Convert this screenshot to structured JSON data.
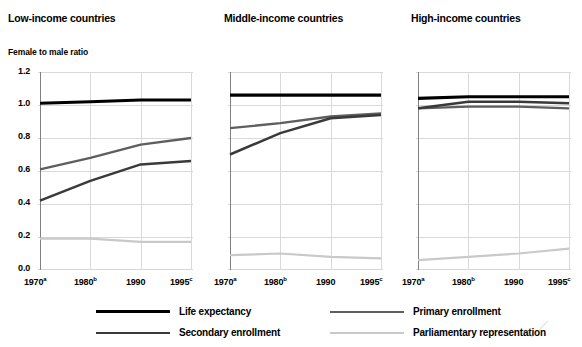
{
  "axis_title": "Female to male ratio",
  "panels": [
    {
      "title": "Low-income countries"
    },
    {
      "title": "Middle-income countries"
    },
    {
      "title": "High-income countries"
    }
  ],
  "yticks": [
    "1.2",
    "1.0",
    "0.8",
    "0.6",
    "0.4",
    "0.2",
    "0.0"
  ],
  "xticks": [
    {
      "year": "1970",
      "note": "a"
    },
    {
      "year": "1980",
      "note": "b"
    },
    {
      "year": "1990",
      "note": ""
    },
    {
      "year": "1995",
      "note": "c"
    }
  ],
  "legend": [
    {
      "label": "Life expectancy",
      "color": "#000000",
      "width": 3.2
    },
    {
      "label": "Primary enrollment",
      "color": "#5e5e5e",
      "width": 2.4
    },
    {
      "label": "Secondary enrollment",
      "color": "#3a3a3a",
      "width": 2.6
    },
    {
      "label": "Parliamentary representation",
      "color": "#c9c9c9",
      "width": 2.2
    }
  ],
  "colors": {
    "life_expectancy": "#000000",
    "primary_enrollment": "#5e5e5e",
    "secondary_enrollment": "#3a3a3a",
    "parliamentary_representation": "#c9c9c9",
    "grid": "#d9d9d9",
    "axis": "#808080",
    "baseline": "#5a5a5a"
  },
  "chart_data": {
    "type": "line",
    "title": "",
    "xlabel": "",
    "ylabel": "Female to male ratio",
    "ylim": [
      0.0,
      1.2
    ],
    "ytick_values": [
      0.0,
      0.2,
      0.4,
      0.6,
      0.8,
      1.0,
      1.2
    ],
    "x": [
      "1970",
      "1980",
      "1990",
      "1995"
    ],
    "grid": true,
    "legend_position": "bottom",
    "footnotes": [
      "a",
      "b",
      "c"
    ],
    "panels": [
      {
        "name": "Low-income countries",
        "series": [
          {
            "name": "Life expectancy",
            "values": [
              1.01,
              1.02,
              1.03,
              1.03
            ]
          },
          {
            "name": "Primary enrollment",
            "values": [
              0.61,
              0.68,
              0.76,
              0.8
            ]
          },
          {
            "name": "Secondary enrollment",
            "values": [
              0.42,
              0.54,
              0.64,
              0.66
            ]
          },
          {
            "name": "Parliamentary representation",
            "values": [
              0.19,
              0.19,
              0.17,
              0.17
            ]
          }
        ]
      },
      {
        "name": "Middle-income countries",
        "series": [
          {
            "name": "Life expectancy",
            "values": [
              1.06,
              1.06,
              1.06,
              1.06
            ]
          },
          {
            "name": "Primary enrollment",
            "values": [
              0.86,
              0.89,
              0.93,
              0.95
            ]
          },
          {
            "name": "Secondary enrollment",
            "values": [
              0.7,
              0.83,
              0.92,
              0.94
            ]
          },
          {
            "name": "Parliamentary representation",
            "values": [
              0.09,
              0.1,
              0.08,
              0.07
            ]
          }
        ]
      },
      {
        "name": "High-income countries",
        "series": [
          {
            "name": "Life expectancy",
            "values": [
              1.04,
              1.05,
              1.05,
              1.05
            ]
          },
          {
            "name": "Primary enrollment",
            "values": [
              0.98,
              0.99,
              0.99,
              0.98
            ]
          },
          {
            "name": "Secondary enrollment",
            "values": [
              0.98,
              1.02,
              1.02,
              1.01
            ]
          },
          {
            "name": "Parliamentary representation",
            "values": [
              0.06,
              0.08,
              0.1,
              0.13
            ]
          }
        ]
      }
    ]
  }
}
